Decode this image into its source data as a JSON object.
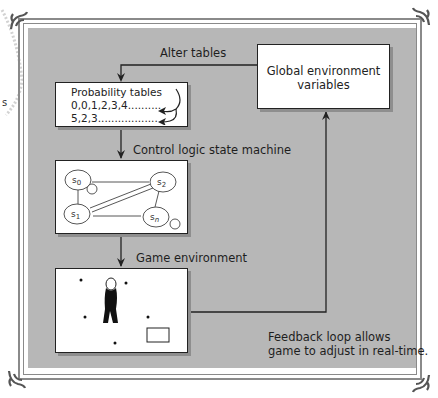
{
  "diagram": {
    "global_box": {
      "line1": "Global environment",
      "line2": "variables"
    },
    "alter_label": "Alter tables",
    "probability_box": {
      "title": "Probability tables",
      "row1": "0,0,1,2,3,4..........",
      "row2": "5,2,3.................."
    },
    "state_machine_label": "Control logic state machine",
    "states": [
      "s0",
      "s1",
      "s2",
      "sn"
    ],
    "game_label": "Game environment",
    "feedback_label": {
      "line1": "Feedback loop allows",
      "line2": "game to adjust in real-time."
    },
    "side_fragment": "s"
  },
  "colors": {
    "panel": "#b7b7b7",
    "frame": "#8a8a8a",
    "line": "#222222"
  }
}
